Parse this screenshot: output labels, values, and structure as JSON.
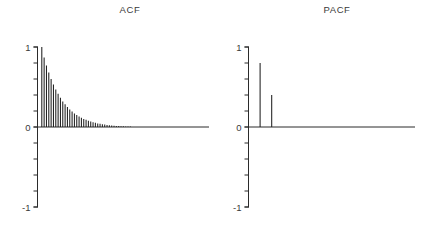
{
  "figure": {
    "background": "#ffffff",
    "line_color": "#2b2b2b",
    "bar_color": "#1f1f1f",
    "text_color": "#3a3a3a"
  },
  "chart_data": [
    {
      "type": "bar",
      "title": "ACF",
      "xlabel": "",
      "ylabel": "",
      "ylim": [
        -1,
        1
      ],
      "y_tick_step": 0.2,
      "grid": false,
      "legend": false,
      "y_labels": [
        {
          "value": 1,
          "label": "1"
        },
        {
          "value": 0,
          "label": "0"
        },
        {
          "value": -1,
          "label": "-1"
        }
      ],
      "lag_start": 0,
      "values": [
        1.0,
        0.87,
        0.77,
        0.68,
        0.6,
        0.53,
        0.47,
        0.415,
        0.365,
        0.32,
        0.285,
        0.25,
        0.22,
        0.195,
        0.17,
        0.15,
        0.13,
        0.115,
        0.1,
        0.09,
        0.078,
        0.068,
        0.06,
        0.052,
        0.045,
        0.04,
        0.034,
        0.03,
        0.026,
        0.022,
        0.019,
        0.016,
        0.014,
        0.012,
        0.01,
        0.008,
        0.007,
        0.006,
        0.005,
        0.004,
        0.003,
        0.003,
        0.002,
        0.002,
        0.001,
        0,
        0,
        0,
        0,
        0,
        0,
        0,
        0,
        0,
        0,
        0,
        0,
        0,
        0,
        0,
        0,
        0,
        0,
        0,
        0,
        0,
        0,
        0,
        0,
        0,
        0,
        0
      ]
    },
    {
      "type": "bar",
      "title": "PACF",
      "xlabel": "",
      "ylabel": "",
      "ylim": [
        -1,
        1
      ],
      "y_tick_step": 0.2,
      "grid": false,
      "legend": false,
      "y_labels": [
        {
          "value": 1,
          "label": "1"
        },
        {
          "value": 0,
          "label": "0"
        },
        {
          "value": -1,
          "label": "-1"
        }
      ],
      "lag_start": 1,
      "values": [
        0.8,
        0.4,
        0,
        0,
        0,
        0,
        0,
        0,
        0,
        0,
        0,
        0,
        0,
        0
      ]
    }
  ]
}
